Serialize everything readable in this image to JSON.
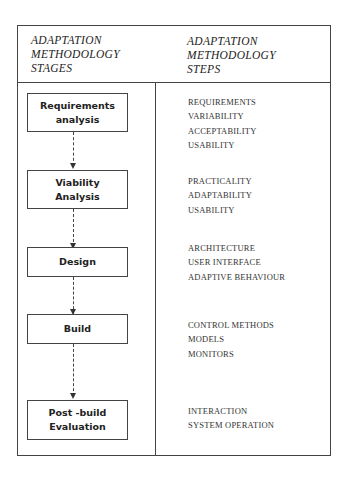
{
  "header": {
    "left": [
      "ADAPTATION",
      "METHODOLOGY",
      "STAGES"
    ],
    "right": [
      "ADAPTATION",
      "METHODOLOGY",
      "STEPS"
    ]
  },
  "stages": [
    {
      "lines": [
        "Requirements",
        "analysis"
      ],
      "steps": [
        "REQUIREMENTS",
        "VARIABILITY",
        "ACCEPTABILITY",
        "USABILITY"
      ]
    },
    {
      "lines": [
        "Viability",
        "Analysis"
      ],
      "steps": [
        "PRACTICALITY",
        "ADAPTABILITY",
        "USABILITY"
      ]
    },
    {
      "lines": [
        "Design"
      ],
      "steps": [
        "ARCHITECTURE",
        "USER INTERFACE",
        "ADAPTIVE BEHAVIOUR"
      ]
    },
    {
      "lines": [
        "Build"
      ],
      "steps": [
        "CONTROL METHODS",
        "MODELS",
        "MONITORS"
      ]
    },
    {
      "lines": [
        "Post -build",
        "Evaluation"
      ],
      "steps": [
        "INTERACTION",
        "SYSTEM OPERATION"
      ]
    }
  ]
}
